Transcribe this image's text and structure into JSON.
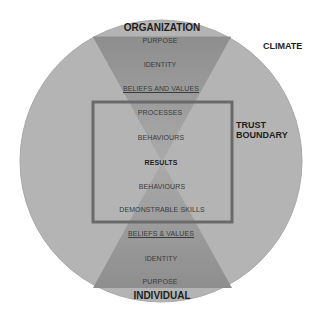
{
  "diagram": {
    "title_top": "ORGANIZATION",
    "title_bottom": "INDIVIDUAL",
    "outer_label": "CLIMATE",
    "boundary_label_line1": "TRUST",
    "boundary_label_line2": "BOUNDARY",
    "top_funnel": [
      "PURPOSE",
      "IDENTITY",
      "BELIEFS AND VALUES"
    ],
    "center_box": [
      "PROCESSES",
      "BEHAVIOURS",
      "RESULTS",
      "BEHAVIOURS",
      "DEMONSTRABLE SKILLS"
    ],
    "bottom_funnel": [
      "BELIEFS & VALUES",
      "IDENTITY",
      "PURPOSE"
    ]
  },
  "colors": {
    "circle_fill": "#b4b4b4",
    "funnel_fill": "#999999",
    "boundary_stroke": "#6a6a6a",
    "text": "#3a3a3a",
    "background": "#ffffff"
  }
}
